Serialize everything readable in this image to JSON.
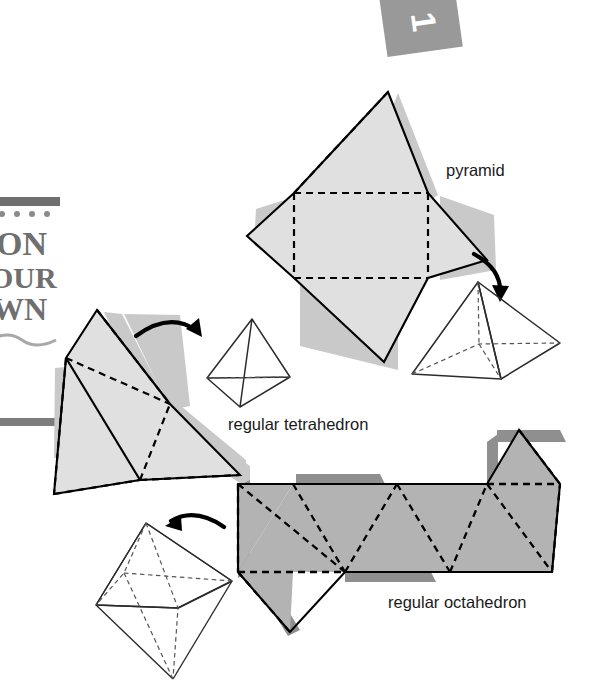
{
  "page": {
    "width": 601,
    "height": 685,
    "background": "#ffffff"
  },
  "colors": {
    "net_light_fill": "#e0e0e0",
    "net_light_shadow": "#c9c9c9",
    "net_dark_fill": "#b3b3b3",
    "net_dark_shadow": "#8f8f8f",
    "outline": "#000000",
    "fold_line": "#000000",
    "solid_line": "#2b2b2b",
    "hidden_line": "#555555",
    "label_text": "#1a1a1a",
    "banner_gray": "#6f6f6f",
    "tab_gray": "#999999",
    "tab_number": "#ffffff"
  },
  "chapter_tab": {
    "number": "1",
    "rotation_deg": -8
  },
  "banner": {
    "line1": "ON",
    "line2": "OUR",
    "line3": "WN",
    "note": "partially cropped 'ON YOUR OWN' banner at left edge"
  },
  "labels": {
    "pyramid": "pyramid",
    "regular_tetrahedron": "regular tetrahedron",
    "regular_octahedron": "regular octahedron"
  },
  "figures": [
    {
      "id": "pyramid-net",
      "name": "square pyramid net",
      "kind": "net",
      "fill": "#e0e0e0",
      "faces": 5,
      "face_shapes": [
        "square base",
        "4 triangular flaps"
      ]
    },
    {
      "id": "pyramid-solid",
      "name": "square pyramid solid",
      "kind": "solid",
      "label": "pyramid"
    },
    {
      "id": "tetrahedron-net",
      "name": "regular tetrahedron net",
      "kind": "net",
      "fill": "#e0e0e0",
      "faces": 4,
      "face_shapes": [
        "4 equilateral triangles"
      ]
    },
    {
      "id": "tetrahedron-solid",
      "name": "regular tetrahedron solid",
      "kind": "solid",
      "label": "regular tetrahedron"
    },
    {
      "id": "octahedron-net",
      "name": "regular octahedron net",
      "kind": "net",
      "fill": "#b3b3b3",
      "faces": 8,
      "face_shapes": [
        "8 equilateral triangles in a strip"
      ]
    },
    {
      "id": "octahedron-solid",
      "name": "regular octahedron solid",
      "kind": "solid",
      "label": "regular octahedron"
    }
  ],
  "arrows": [
    {
      "id": "arrow-pyramid",
      "from": "pyramid-net",
      "to": "pyramid-solid",
      "direction": "down-right"
    },
    {
      "id": "arrow-tetrahedron",
      "from": "tetrahedron-net",
      "to": "tetrahedron-solid",
      "direction": "right"
    },
    {
      "id": "arrow-octahedron",
      "from": "octahedron-net",
      "to": "octahedron-solid",
      "direction": "left"
    }
  ]
}
